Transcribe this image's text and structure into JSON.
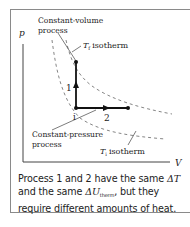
{
  "diagram": {
    "type": "pV-diagram",
    "axes": {
      "y_label": "p",
      "x_label": "V"
    },
    "labels": {
      "constant_volume_line1": "Constant-volume",
      "constant_volume_line2": "process",
      "constant_pressure_line1": "Constant-pressure",
      "constant_pressure_line2": "process",
      "tf_isotherm_symbol": "T",
      "tf_isotherm_sub": "f",
      "tf_isotherm_word": "isotherm",
      "ti_isotherm_symbol": "T",
      "ti_isotherm_sub": "i",
      "ti_isotherm_word": "isotherm",
      "point_initial": "i",
      "process_1": "1",
      "process_2": "2"
    },
    "colors": {
      "frame": "#8a8a8a",
      "lines": "#222222",
      "dashed": "#777777"
    }
  },
  "caption": {
    "line1_prefix": "Process 1 and 2 have the same ",
    "line1_symbol": "ΔT",
    "line2_prefix": "and the same ",
    "line2_symbol": "ΔU",
    "line2_sub": "therm",
    "line2_suffix": ", but they",
    "line3": "require different amounts of heat."
  }
}
